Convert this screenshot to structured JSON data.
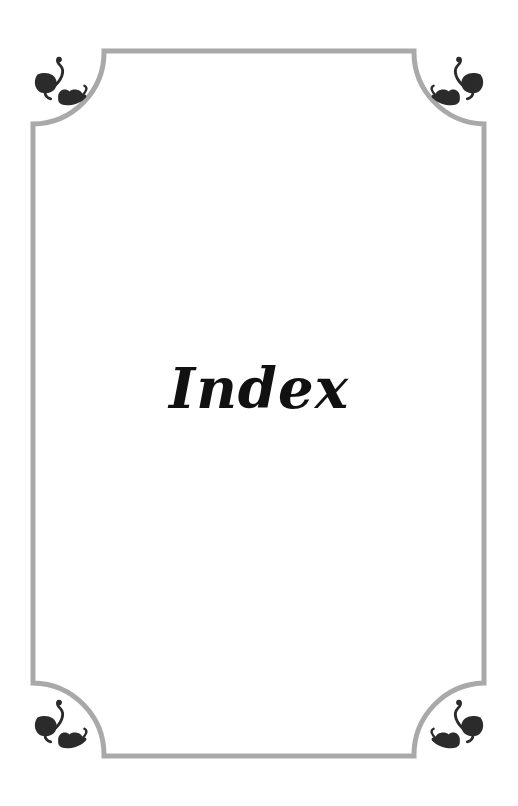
{
  "page": {
    "title": "Index",
    "colors": {
      "frame": "#a9a9a9",
      "ornament": "#2b2b2b",
      "text": "#111111",
      "background": "#ffffff"
    },
    "ornaments": [
      "paisley-flourish-icon",
      "paisley-flourish-icon",
      "paisley-flourish-icon",
      "paisley-flourish-icon"
    ]
  }
}
